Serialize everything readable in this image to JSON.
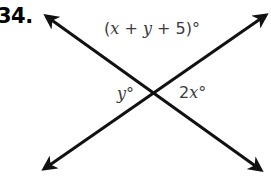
{
  "problem": {
    "number": "34."
  },
  "figure": {
    "type": "two-intersecting-lines",
    "intersection": {
      "x": 158,
      "y": 95
    },
    "line_1": {
      "name": "line-top-left-to-bottom-right",
      "from": {
        "x": 42,
        "y": 13
      },
      "to": {
        "x": 265,
        "y": 173
      },
      "arrowheads": "both"
    },
    "line_2": {
      "name": "line-bottom-left-to-top-right",
      "from": {
        "x": 40,
        "y": 172
      },
      "to": {
        "x": 270,
        "y": 12
      },
      "arrowheads": "both"
    },
    "stroke_color": "#111111",
    "stroke_width": 3
  },
  "labels": {
    "top": {
      "text": "(x + y + 5)°",
      "open_paren": "(",
      "var_x": "x",
      "plus_1": "+",
      "var_y": "y",
      "plus_2": "+",
      "num_5": "5",
      "close_paren": ")",
      "degree": "°",
      "color": "#3b3b3b"
    },
    "left": {
      "text": "y°",
      "var": "y",
      "degree": "°",
      "color": "#3b3b3b"
    },
    "right": {
      "text": "2x°",
      "coefficient": "2",
      "var": "x",
      "degree": "°",
      "color": "#3b3b3b"
    }
  }
}
